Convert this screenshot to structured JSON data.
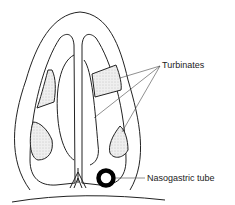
{
  "diagram": {
    "labels": {
      "turbinates": "Turbinates",
      "nasogastric_tube": "Nasogastric tube"
    },
    "colors": {
      "line": "#222222",
      "stipple": "#bdbdbd",
      "background": "#ffffff"
    }
  }
}
